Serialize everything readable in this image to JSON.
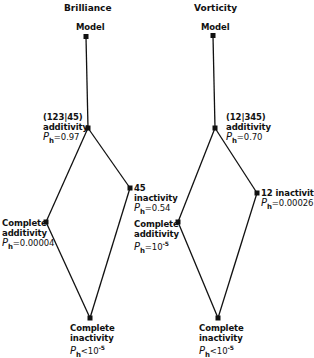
{
  "panels": [
    {
      "title": "Brilliance",
      "nodes": {
        "model": {
          "label": "Model"
        },
        "partial_additivity": {
          "line1": "(123|45)",
          "line2": "additivity",
          "p_op": "=",
          "p_val": "0.97"
        },
        "partial_inactivity": {
          "line1": "45",
          "line2": "inactivity",
          "p_op": "=",
          "p_val": "0.54"
        },
        "complete_additivity": {
          "line1": "Complete",
          "line2": "additivity",
          "p_op": "=",
          "p_val": "0.00004"
        },
        "complete_inactivity": {
          "line1": "Complete",
          "line2": "inactivity",
          "p_op": "<",
          "p_val": "10",
          "p_exp": "-5"
        }
      }
    },
    {
      "title": "Vorticity",
      "nodes": {
        "model": {
          "label": "Model"
        },
        "partial_additivity": {
          "line1": "(12|345)",
          "line2": "additivity",
          "p_op": "=",
          "p_val": "0.70"
        },
        "partial_inactivity": {
          "line1": "12 inactivity",
          "p_op": "=",
          "p_val": "0.00026"
        },
        "complete_additivity": {
          "line1": "Complete",
          "line2": "additivity",
          "p_op": "=",
          "p_val": "10",
          "p_exp": "-5"
        },
        "complete_inactivity": {
          "line1": "Complete",
          "line2": "inactivity",
          "p_op": "<",
          "p_val": "10",
          "p_exp": "-5"
        }
      }
    }
  ],
  "p_symbol": "P",
  "p_subscript": "h"
}
